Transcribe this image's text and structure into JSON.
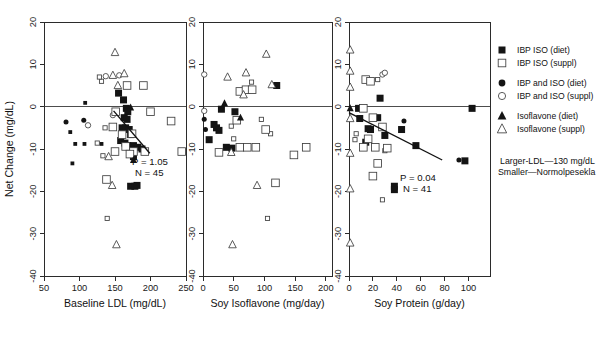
{
  "figure": {
    "title": "",
    "background": "#ffffff",
    "ink_color": "#141414"
  },
  "legend": {
    "position": "right",
    "items": [
      {
        "label": "IBP ISO (diet)",
        "marker": "filled-square",
        "icon_name": "filled-square-icon"
      },
      {
        "label": "IBP ISO (suppl)",
        "marker": "open-square",
        "icon_name": "open-square-icon"
      },
      {
        "label": "IBP and ISO (diet)",
        "marker": "filled-circle",
        "icon_name": "filled-circle-icon"
      },
      {
        "label": "IBP and ISO (suppl)",
        "marker": "open-circle",
        "icon_name": "open-circle-icon"
      },
      {
        "label": "Isoflavone (diet)",
        "marker": "filled-triangle",
        "icon_name": "filled-triangle-icon"
      },
      {
        "label": "Isoflavone (suppl)",
        "marker": "open-triangle",
        "icon_name": "open-triangle-icon"
      }
    ]
  },
  "annotation": {
    "line1": "Larger-LDL—130 mg/dL",
    "line2": "Smaller—Normolpesekla"
  },
  "chart_data": [
    {
      "type": "scatter",
      "panel": 1,
      "title": "",
      "xlabel": "Baseline LDL (mg/dL)",
      "ylabel": "Net Change (mg/dL)",
      "xlim": [
        50,
        250
      ],
      "ylim": [
        -40,
        20
      ],
      "xticks": [
        50,
        100,
        150,
        200,
        250
      ],
      "yticks": [
        20,
        10,
        0,
        -10,
        -20,
        -30,
        -40
      ],
      "grid": false,
      "zero_line": 0,
      "stats": {
        "p_label": "P = 1.05",
        "n_label": "N = 45"
      },
      "fit_line": {
        "x1": 148,
        "y1": -1.0,
        "x2": 199,
        "y2": -11.0
      },
      "series": [
        {
          "name": "IBP ISO (diet)",
          "marker": "filled-square",
          "size": "small",
          "points": [
            [
              87,
              -6.0
            ],
            [
              94,
              -8.8
            ],
            [
              107,
              -8.8
            ],
            [
              108,
              0.9
            ],
            [
              90,
              -13.4
            ],
            [
              131,
              -8.8
            ]
          ]
        },
        {
          "name": "IBP ISO (diet)",
          "marker": "filled-square",
          "size": "large",
          "points": [
            [
              155,
              3.2
            ],
            [
              162,
              1.6
            ],
            [
              166,
              -0.4
            ],
            [
              168,
              -1.2
            ],
            [
              163,
              -2.6
            ],
            [
              167,
              -3.0
            ],
            [
              160,
              -5.0
            ],
            [
              165,
              -5.0
            ],
            [
              170,
              -5.4
            ],
            [
              172,
              -6.6
            ],
            [
              158,
              -8.0
            ],
            [
              164,
              -8.6
            ],
            [
              168,
              -9.2
            ],
            [
              176,
              -9.2
            ],
            [
              182,
              -9.6
            ],
            [
              188,
              -10.0
            ],
            [
              176,
              -11.8
            ],
            [
              172,
              -18.8
            ],
            [
              178,
              -18.8
            ],
            [
              181,
              -18.6
            ]
          ]
        },
        {
          "name": "IBP and ISO (diet)",
          "marker": "filled-circle",
          "size": "small",
          "points": [
            [
              81,
              -3.6
            ],
            [
              106,
              -3.2
            ]
          ]
        },
        {
          "name": "IBP and ISO (suppl)",
          "marker": "open-circle",
          "size": "small",
          "points": [
            [
              137,
              7.2
            ],
            [
              156,
              7.4
            ],
            [
              147,
              -2.0
            ],
            [
              112,
              -4.4
            ]
          ]
        },
        {
          "name": "IBP ISO (suppl)",
          "marker": "open-square",
          "size": "small",
          "points": [
            [
              131,
              6.0
            ],
            [
              128,
              7.0
            ],
            [
              136,
              -5.0
            ],
            [
              125,
              -8.6
            ],
            [
              133,
              -11.6
            ],
            [
              139,
              -26.4
            ]
          ]
        },
        {
          "name": "IBP ISO (suppl)",
          "marker": "open-square",
          "size": "large",
          "points": [
            [
              167,
              5.0
            ],
            [
              190,
              5.0
            ],
            [
              151,
              -1.2
            ],
            [
              200,
              -1.2
            ],
            [
              229,
              -3.4
            ],
            [
              147,
              -4.8
            ],
            [
              160,
              -6.6
            ],
            [
              174,
              -6.4
            ],
            [
              165,
              -9.4
            ],
            [
              176,
              -10.6
            ],
            [
              192,
              -10.6
            ],
            [
              244,
              -10.6
            ],
            [
              150,
              -10.6
            ],
            [
              138,
              -17.2
            ],
            [
              171,
              -11.2
            ]
          ]
        },
        {
          "name": "Isoflavone (diet)",
          "marker": "filled-triangle",
          "size": "small",
          "points": [
            [
              172,
              -0.2
            ],
            [
              176,
              -12.6
            ]
          ]
        },
        {
          "name": "Isoflavone (suppl)",
          "marker": "open-triangle",
          "size": "small",
          "points": [
            [
              150,
              12.8
            ],
            [
              147,
              7.4
            ],
            [
              163,
              7.8
            ],
            [
              154,
              5.0
            ],
            [
              141,
              -11.8
            ],
            [
              146,
              -18.6
            ],
            [
              152,
              -32.6
            ]
          ]
        }
      ]
    },
    {
      "type": "scatter",
      "panel": 2,
      "title": "",
      "xlabel": "Soy Isoflavone (mg/day)",
      "ylabel": "Net Change (mg/dL)",
      "xlim": [
        0,
        210
      ],
      "ylim": [
        -40,
        20
      ],
      "xticks": [
        0,
        50,
        100,
        150,
        200
      ],
      "yticks": [
        20,
        10,
        0,
        -10,
        -20,
        -30,
        -40
      ],
      "grid": false,
      "zero_line": 0,
      "stats": {
        "p_label": "",
        "n_label": ""
      },
      "fit_line": null,
      "series": [
        {
          "name": "IBP ISO (diet)",
          "marker": "filled-square",
          "size": "large",
          "points": [
            [
              120,
              5.0
            ],
            [
              30,
              -0.6
            ],
            [
              52,
              -1.2
            ],
            [
              18,
              -4.2
            ],
            [
              22,
              -5.0
            ],
            [
              26,
              -5.6
            ],
            [
              10,
              -7.8
            ],
            [
              38,
              -9.6
            ],
            [
              47,
              -9.8
            ]
          ]
        },
        {
          "name": "IBP and ISO (diet)",
          "marker": "filled-circle",
          "size": "small",
          "points": [
            [
              2,
              -3.0
            ],
            [
              4,
              -5.4
            ]
          ]
        },
        {
          "name": "IBP and ISO (suppl)",
          "marker": "open-circle",
          "size": "small",
          "points": [
            [
              2,
              7.6
            ],
            [
              2,
              -1.0
            ]
          ]
        },
        {
          "name": "IBP ISO (suppl)",
          "marker": "open-square",
          "size": "small",
          "points": [
            [
              79,
              5.8
            ],
            [
              95,
              -3.0
            ],
            [
              110,
              -6.4
            ],
            [
              50,
              -7.6
            ],
            [
              105,
              -26.4
            ],
            [
              46,
              -4.6
            ]
          ]
        },
        {
          "name": "IBP ISO (suppl)",
          "marker": "open-square",
          "size": "large",
          "points": [
            [
              60,
              3.6
            ],
            [
              70,
              4.0
            ],
            [
              80,
              4.0
            ],
            [
              55,
              -3.2
            ],
            [
              102,
              -5.4
            ],
            [
              60,
              -9.6
            ],
            [
              72,
              -9.6
            ],
            [
              86,
              -9.6
            ],
            [
              26,
              -10.8
            ],
            [
              148,
              -11.4
            ],
            [
              168,
              -9.6
            ],
            [
              118,
              -18.0
            ]
          ]
        },
        {
          "name": "Isoflavone (diet)",
          "marker": "filled-triangle",
          "size": "small",
          "points": [
            [
              35,
              0.8
            ],
            [
              61,
              -2.6
            ]
          ]
        },
        {
          "name": "Isoflavone (suppl)",
          "marker": "open-triangle",
          "size": "small",
          "points": [
            [
              103,
              12.4
            ],
            [
              40,
              7.0
            ],
            [
              70,
              8.0
            ],
            [
              112,
              5.2
            ],
            [
              66,
              2.8
            ],
            [
              46,
              -10.8
            ],
            [
              88,
              -18.6
            ],
            [
              48,
              -32.6
            ]
          ]
        }
      ]
    },
    {
      "type": "scatter",
      "panel": 3,
      "title": "",
      "xlabel": "Soy Protein (g/day)",
      "ylabel": "Net Change (mg/dL)",
      "xlim": [
        0,
        118
      ],
      "ylim": [
        -40,
        20
      ],
      "xticks": [
        0,
        20,
        40,
        60,
        80,
        100
      ],
      "yticks": [
        20,
        10,
        0,
        -10,
        -20,
        -30,
        -40
      ],
      "grid": false,
      "zero_line": 0,
      "stats": {
        "p_label": "P = 0.04",
        "n_label": "N = 41"
      },
      "fit_line": {
        "x1": 0,
        "y1": -1.4,
        "x2": 78,
        "y2": -12.6
      },
      "series": [
        {
          "name": "IBP ISO (diet)",
          "marker": "filled-square",
          "size": "large",
          "points": [
            [
              26,
              2.0
            ],
            [
              8,
              -0.4
            ],
            [
              9,
              -2.8
            ],
            [
              24,
              -2.6
            ],
            [
              16,
              -5.2
            ],
            [
              18,
              -5.4
            ],
            [
              30,
              -6.8
            ],
            [
              44,
              -5.4
            ],
            [
              14,
              -8.4
            ],
            [
              22,
              -9.6
            ],
            [
              56,
              -9.2
            ],
            [
              103,
              -0.4
            ],
            [
              97,
              -12.8
            ],
            [
              38,
              -18.8
            ],
            [
              38,
              -19.6
            ]
          ]
        },
        {
          "name": "IBP and ISO (diet)",
          "marker": "filled-circle",
          "size": "small",
          "points": [
            [
              46,
              -3.4
            ],
            [
              92,
              -12.6
            ]
          ]
        },
        {
          "name": "IBP and ISO (suppl)",
          "marker": "open-circle",
          "size": "small",
          "points": [
            [
              28,
              7.6
            ],
            [
              30,
              8.0
            ]
          ]
        },
        {
          "name": "IBP ISO (suppl)",
          "marker": "open-square",
          "size": "small",
          "points": [
            [
              6,
              -6.4
            ],
            [
              5,
              -7.8
            ],
            [
              24,
              6.4
            ],
            [
              30,
              -10.4
            ],
            [
              28,
              -22.0
            ]
          ]
        },
        {
          "name": "IBP ISO (suppl)",
          "marker": "open-square",
          "size": "large",
          "points": [
            [
              14,
              6.4
            ],
            [
              18,
              6.0
            ],
            [
              12,
              -0.4
            ],
            [
              20,
              -2.6
            ],
            [
              28,
              -4.8
            ],
            [
              16,
              -7.6
            ],
            [
              12,
              -9.6
            ],
            [
              22,
              -9.6
            ],
            [
              32,
              -9.8
            ],
            [
              24,
              -13.4
            ],
            [
              20,
              -16.4
            ]
          ]
        },
        {
          "name": "Isoflavone (diet)",
          "marker": "filled-triangle",
          "size": "small",
          "points": [
            [
              1,
              -0.4
            ]
          ]
        },
        {
          "name": "Isoflavone (suppl)",
          "marker": "open-triangle",
          "size": "small",
          "points": [
            [
              1,
              13.4
            ],
            [
              1,
              8.4
            ],
            [
              1,
              4.6
            ],
            [
              1,
              -2.8
            ],
            [
              1,
              -11.0
            ],
            [
              1,
              -19.4
            ],
            [
              1,
              -32.2
            ]
          ]
        }
      ]
    }
  ]
}
